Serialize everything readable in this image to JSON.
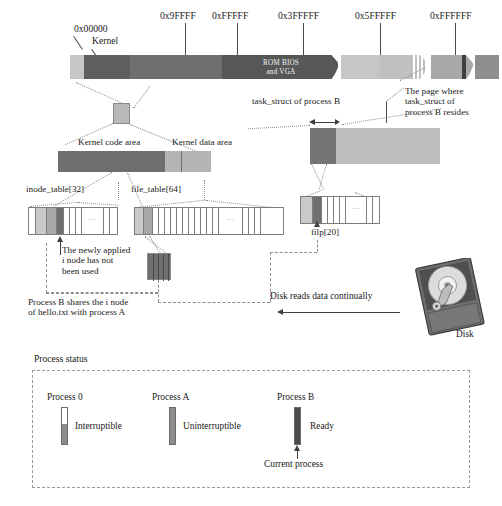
{
  "diagram": {
    "title_hidden": "",
    "memory_bar": {
      "addresses": [
        {
          "label": "0x00000"
        },
        {
          "label": "0x9FFFF"
        },
        {
          "label": "0xFFFFF"
        },
        {
          "label": "0x3FFFFF"
        },
        {
          "label": "0x5FFFFF"
        },
        {
          "label": "0xFFFFFF"
        }
      ],
      "kernel_label": "Kernel",
      "rom_bios_line1": "ROM BIOS",
      "rom_bios_line2": "and VGA"
    },
    "kernel_detail": {
      "code_area_label": "Kernel code area",
      "data_area_label": "Kernel data area"
    },
    "task_struct": {
      "caption": "task_struct of process B",
      "page_note_line1": "The page where",
      "page_note_line2": "task_struct of",
      "page_note_line3": "process B resides"
    },
    "tables": {
      "inode_table_label": "inode_table[32]",
      "file_table_label": "file_table[64]",
      "filp_label": "filp[20]",
      "cell_ellipsis": "···"
    },
    "notes": {
      "new_inode_line1": "The newly applied",
      "new_inode_line2": "i node has not",
      "new_inode_line3": "been used",
      "shared_inode_line1": "Process B shares the i node",
      "shared_inode_line2": "of hello.txt with process A"
    },
    "disk": {
      "read_caption": "Disk reads data continually",
      "label": "Disk"
    },
    "legend": {
      "heading": "Process status",
      "current_process_label": "Current process",
      "entries": [
        {
          "name": "Process 0",
          "status": "Interruptible",
          "fill_ratio": 0.55,
          "color": "#8c8c8c"
        },
        {
          "name": "Process A",
          "status": "Uninterruptible",
          "fill_ratio": 1.0,
          "color": "#8c8c8c"
        },
        {
          "name": "Process B",
          "status": "Ready",
          "fill_ratio": 1.0,
          "color": "#4a4a4a"
        }
      ]
    },
    "colors": {
      "light_gray": "#c6c6c6",
      "mid_gray": "#9f9f9f",
      "dark_gray": "#636363",
      "darkest_gray": "#4a4a4a",
      "outline": "#7d7d7d",
      "dash": "#8d8d8d",
      "text": "#1a1a1a"
    }
  }
}
